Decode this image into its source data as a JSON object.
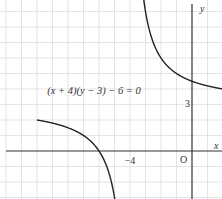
{
  "chart_data": {
    "type": "line",
    "title": "",
    "annotation": "(x + 4)(y − 3) − 6 = 0",
    "xlabel": "x",
    "ylabel": "y",
    "origin_label": "O",
    "tick_labels": {
      "x": [
        "−4"
      ],
      "y": [
        "3"
      ]
    },
    "xlim": [
      -12.4,
      1.9
    ],
    "ylim": [
      -3.1,
      9.7
    ],
    "grid": true,
    "unit_px": 15.5,
    "asymptotes": {
      "vertical": -4,
      "horizontal": 3
    },
    "series": [
      {
        "name": "left branch",
        "x": [
          -10,
          -9,
          -8,
          -7,
          -6,
          -5.5,
          -5
        ],
        "y": [
          2,
          1.8,
          1.5,
          1,
          0,
          -1,
          -3
        ]
      },
      {
        "name": "right branch",
        "x": [
          -3.1,
          -3,
          -2.5,
          -2,
          -1,
          0,
          1,
          1.9
        ],
        "y": [
          9.67,
          9,
          7,
          6,
          4.2,
          4.5,
          4.2,
          4.02
        ]
      }
    ]
  },
  "labels": {
    "equation": "(x + 4)(y − 3) − 6 = 0",
    "x_axis": "x",
    "y_axis": "y",
    "origin": "O",
    "tick_x_neg4": "−4",
    "tick_y_3": "3"
  }
}
